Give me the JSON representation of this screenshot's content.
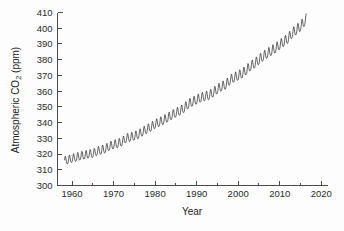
{
  "chart_data": {
    "type": "line",
    "title": "",
    "xlabel": "Year",
    "ylabel": "Atmospheric CO2 (ppm)",
    "ylabel_parts": {
      "pre": "Atmospheric CO",
      "sub": "2",
      "post": " (ppm)"
    },
    "xlim": [
      1956.5,
      2021.5
    ],
    "ylim": [
      300,
      410
    ],
    "x_major_ticks": [
      1960,
      1970,
      1980,
      1990,
      2000,
      2010,
      2020
    ],
    "x_minor_ticks": [
      1965,
      1975,
      1985,
      1995,
      2005,
      2015
    ],
    "x_tick_labels": [
      "1960",
      "1970",
      "1980",
      "1990",
      "2000",
      "2010",
      "2020"
    ],
    "y_major_ticks": [
      300,
      310,
      320,
      330,
      340,
      350,
      360,
      370,
      380,
      390,
      400,
      410
    ],
    "y_tick_labels": [
      "300",
      "310",
      "320",
      "330",
      "340",
      "350",
      "360",
      "370",
      "380",
      "390",
      "400",
      "410"
    ],
    "grid": false,
    "legend": "none",
    "line_color": "#2a2a2a",
    "background_color": "#fdfdfd",
    "axis_color": "#4a4a4a",
    "series_name": "Mauna Loa monthly mean CO2",
    "annual_mean": {
      "x": [
        1958,
        1959,
        1960,
        1961,
        1962,
        1963,
        1964,
        1965,
        1966,
        1967,
        1968,
        1969,
        1970,
        1971,
        1972,
        1973,
        1974,
        1975,
        1976,
        1977,
        1978,
        1979,
        1980,
        1981,
        1982,
        1983,
        1984,
        1985,
        1986,
        1987,
        1988,
        1989,
        1990,
        1991,
        1992,
        1993,
        1994,
        1995,
        1996,
        1997,
        1998,
        1999,
        2000,
        2001,
        2002,
        2003,
        2004,
        2005,
        2006,
        2007,
        2008,
        2009,
        2010,
        2011,
        2012,
        2013,
        2014,
        2015,
        2016
      ],
      "y": [
        315.3,
        315.98,
        316.91,
        317.64,
        318.45,
        318.99,
        319.62,
        320.04,
        321.38,
        322.16,
        323.04,
        324.62,
        325.68,
        326.32,
        327.45,
        329.68,
        330.25,
        331.15,
        332.15,
        333.9,
        335.5,
        336.85,
        338.69,
        339.93,
        341.13,
        342.78,
        344.42,
        345.9,
        347.15,
        348.93,
        351.48,
        352.91,
        354.19,
        355.59,
        356.37,
        357.04,
        358.89,
        360.88,
        362.64,
        363.76,
        366.63,
        368.31,
        369.48,
        371.02,
        373.1,
        375.64,
        377.38,
        379.67,
        381.84,
        383.55,
        385.34,
        386.95,
        389.21,
        391.15,
        393.22,
        396.48,
        398.65,
        400.83,
        404.21
      ]
    },
    "seasonal_amplitude_ppm": {
      "start_year_1958": 5.8,
      "end_year_2016": 7.0
    },
    "seasonal_peak_month": "May",
    "seasonal_trough_month": "September",
    "data_start_year": 1958.2,
    "data_end_year": 2016.4,
    "value_range_ppm": [
      312.4,
      407.5
    ]
  }
}
